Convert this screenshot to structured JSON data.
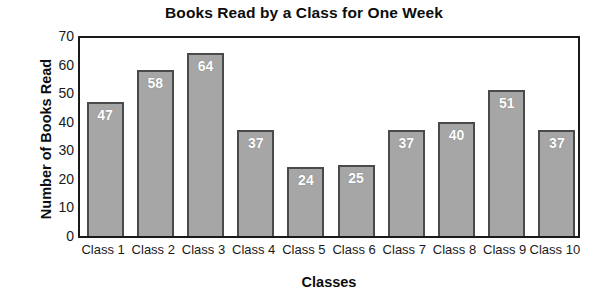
{
  "chart_data": {
    "type": "bar",
    "title": "Books Read by a Class for One Week",
    "xlabel": "Classes",
    "ylabel": "Number of Books Read",
    "categories": [
      "Class 1",
      "Class 2",
      "Class 3",
      "Class 4",
      "Class 5",
      "Class 6",
      "Class 7",
      "Class 8",
      "Class 9",
      "Class 10"
    ],
    "values": [
      47,
      58,
      64,
      37,
      24,
      25,
      37,
      40,
      51,
      37
    ],
    "data_labels": [
      "47",
      "58",
      "64",
      "37",
      "24",
      "25",
      "37",
      "40",
      "51",
      "37"
    ],
    "ylim": [
      0,
      70
    ],
    "ytick_labels": [
      "70",
      "60",
      "50",
      "40",
      "30",
      "20",
      "10",
      "0"
    ],
    "ytick_values": [
      70,
      60,
      50,
      40,
      30,
      20,
      10,
      0
    ],
    "ytick_step": 10,
    "grid": false,
    "legend": null,
    "bar_fill_color": "#a6a6a6",
    "bar_border_color": "#4a4a4a",
    "data_label_color": "#ffffff",
    "axis_color": "#1a1a1a",
    "background_color": "#ffffff"
  }
}
